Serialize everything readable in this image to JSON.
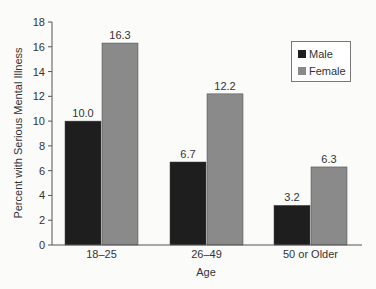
{
  "chart_data": {
    "type": "bar",
    "title": "",
    "xlabel": "Age",
    "ylabel": "Percent with Serious Mental Illness",
    "ylim": [
      0,
      18
    ],
    "yticks": [
      0,
      2,
      4,
      6,
      8,
      10,
      12,
      14,
      16,
      18
    ],
    "grid": false,
    "legend_position": "upper right",
    "categories": [
      "18–25",
      "26–49",
      "50 or Older"
    ],
    "series": [
      {
        "name": "Male",
        "values": [
          10.0,
          6.7,
          3.2
        ],
        "labels": [
          "10.0",
          "6.7",
          "3.2"
        ],
        "color": "#1e1e1e"
      },
      {
        "name": "Female",
        "values": [
          16.3,
          12.2,
          6.3
        ],
        "labels": [
          "16.3",
          "12.2",
          "6.3"
        ],
        "color": "#8a8a8a"
      }
    ]
  },
  "legend": {
    "male_label": "Male",
    "female_label": "Female",
    "male_color": "#1e1e1e",
    "female_color": "#8a8a8a"
  }
}
